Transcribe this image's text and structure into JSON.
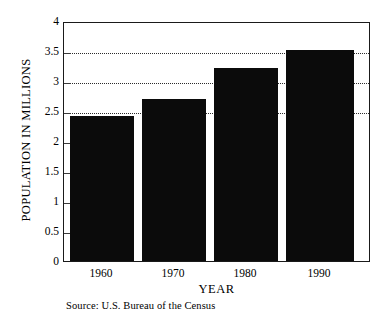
{
  "chart_data": {
    "type": "bar",
    "title": "",
    "categories": [
      "1960",
      "1970",
      "1980",
      "1990"
    ],
    "values": [
      2.43,
      2.73,
      3.25,
      3.55
    ],
    "series": [
      {
        "name": "Population",
        "values": [
          2.43,
          2.73,
          3.25,
          3.55
        ]
      }
    ],
    "xlabel": "YEAR",
    "ylabel": "POPULATION IN MILLIONS",
    "ylim": [
      0,
      4
    ],
    "yticks": [
      "0",
      "0.5",
      "1",
      "1.5",
      "2",
      "2.5",
      "3",
      "3.5",
      "4"
    ],
    "ytick_values": [
      0,
      0.5,
      1,
      1.5,
      2,
      2.5,
      3,
      3.5,
      4
    ],
    "xticks": [
      "1960",
      "1970",
      "1980",
      "1990"
    ],
    "grid": "horizontal-dotted",
    "gridline_values": [
      2.5,
      3,
      3.5
    ],
    "legend": "none",
    "bar_color": "#0b0b0b",
    "axis_color": "#1a1a1a",
    "background_color": "#ffffff",
    "source_note": "Source:  U.S. Bureau of the Census"
  }
}
